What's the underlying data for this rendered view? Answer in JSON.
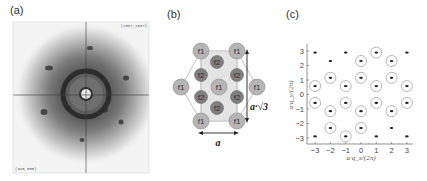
{
  "panels": {
    "a": {
      "label": "(a)",
      "corner_top_right": "(1087,1637)",
      "corner_bottom_left": "(345,555)",
      "description": "diffraction pattern with central spot, dark ring and hexagonal outer spots"
    },
    "b": {
      "label": "(b)",
      "site_f1": "f1",
      "site_f2": "f2",
      "width_label": "a",
      "height_label": "a·√3",
      "colors": {
        "f1_fill": "#b5b5b5",
        "f2_fill": "#7f7f7f",
        "cell_fill": "#e4e4e4",
        "outline": "#bdbdbd"
      },
      "f1_sites": [
        [
          201,
          51
        ],
        [
          237,
          51
        ],
        [
          181,
          87
        ],
        [
          219,
          87
        ],
        [
          257,
          87
        ],
        [
          201,
          121
        ],
        [
          237,
          121
        ]
      ],
      "f2_sites": [
        [
          217,
          62
        ],
        [
          201,
          75
        ],
        [
          237,
          75
        ],
        [
          201,
          97
        ],
        [
          237,
          97
        ],
        [
          217,
          108
        ]
      ]
    },
    "c": {
      "label": "(c)"
    }
  },
  "chart_data": {
    "type": "scatter",
    "title": "",
    "xlabel": "a·q_x/(2π)",
    "ylabel": "a·q_y/(2π)",
    "xlim": [
      -3.3,
      3.4
    ],
    "ylim": [
      -3.4,
      3.5
    ],
    "xticks": [
      -3,
      -2,
      -1,
      0,
      1,
      2,
      3
    ],
    "yticks": [
      3,
      2,
      1,
      0,
      -1,
      -2,
      -3
    ],
    "xtick_labels": [
      "−3",
      "−2",
      "−1",
      "0",
      "1",
      "2",
      "3"
    ],
    "ytick_labels": [
      "3",
      "2",
      "1",
      "0",
      "−1",
      "−2",
      "−3"
    ],
    "grid": false,
    "series": [
      {
        "name": "Bragg peaks (dots)",
        "points": [
          {
            "x": -3,
            "y": 2.89,
            "circled": false
          },
          {
            "x": -1,
            "y": 2.89,
            "circled": false
          },
          {
            "x": 1,
            "y": 2.89,
            "circled": true
          },
          {
            "x": 3,
            "y": 2.89,
            "circled": false
          },
          {
            "x": -2,
            "y": 2.31,
            "circled": false
          },
          {
            "x": 0,
            "y": 2.31,
            "circled": true
          },
          {
            "x": 2,
            "y": 2.31,
            "circled": true
          },
          {
            "x": -2,
            "y": 1.15,
            "circled": true
          },
          {
            "x": 0,
            "y": 1.15,
            "circled": true
          },
          {
            "x": 2,
            "y": 1.15,
            "circled": true
          },
          {
            "x": -3,
            "y": 0.58,
            "circled": true
          },
          {
            "x": -1,
            "y": 0.58,
            "circled": true
          },
          {
            "x": 1,
            "y": 0.58,
            "circled": true
          },
          {
            "x": 3,
            "y": 0.58,
            "circled": true
          },
          {
            "x": -3,
            "y": -0.58,
            "circled": true
          },
          {
            "x": -1,
            "y": -0.58,
            "circled": true
          },
          {
            "x": 1,
            "y": -0.58,
            "circled": true
          },
          {
            "x": 3,
            "y": -0.58,
            "circled": true
          },
          {
            "x": -2,
            "y": -1.15,
            "circled": true
          },
          {
            "x": 0,
            "y": -1.15,
            "circled": true
          },
          {
            "x": 2,
            "y": -1.15,
            "circled": true
          },
          {
            "x": -2,
            "y": -2.31,
            "circled": true
          },
          {
            "x": 0,
            "y": -2.31,
            "circled": true
          },
          {
            "x": 2,
            "y": -2.31,
            "circled": false
          },
          {
            "x": -3,
            "y": -2.89,
            "circled": false
          },
          {
            "x": -1,
            "y": -2.89,
            "circled": true
          },
          {
            "x": 1,
            "y": -2.89,
            "circled": false
          },
          {
            "x": 3,
            "y": -2.89,
            "circled": false
          }
        ]
      }
    ],
    "legend": null
  }
}
